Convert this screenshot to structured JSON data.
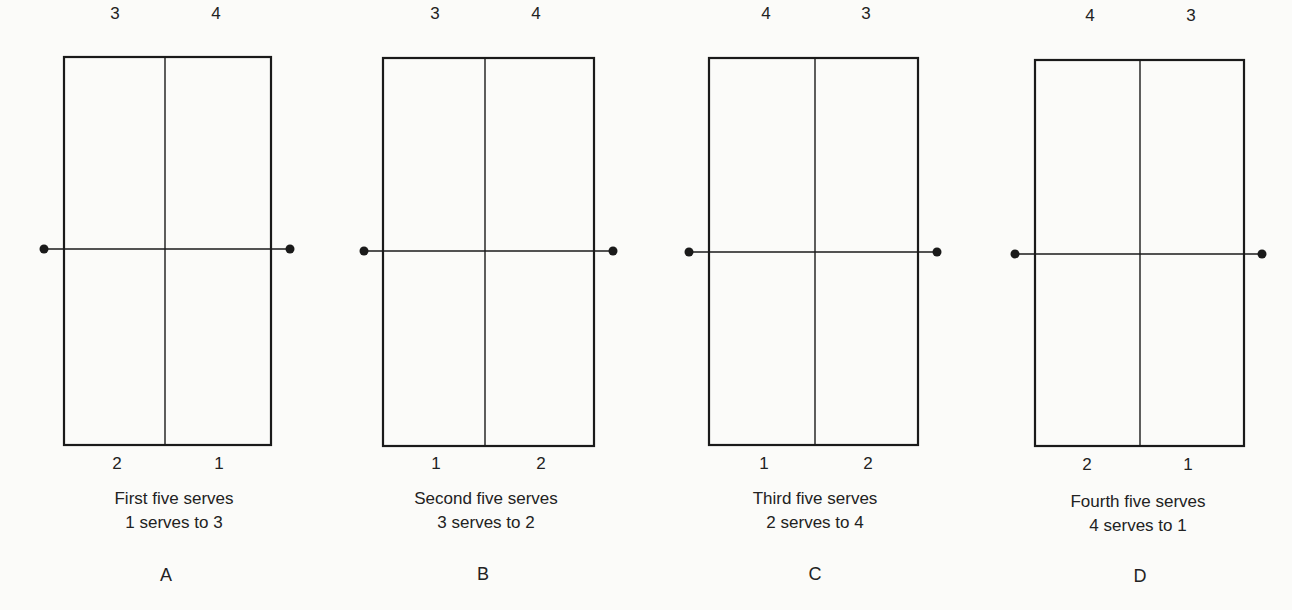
{
  "figure": {
    "line_color": "#1a1a1a",
    "panels": [
      {
        "letter": "A",
        "caption_line1": "First five serves",
        "caption_line2": "1 serves to 3",
        "top_left": "3",
        "top_right": "4",
        "bottom_left": "2",
        "bottom_right": "1",
        "box": {
          "x1": 64,
          "y1": 57,
          "x2": 271,
          "y2": 445,
          "cx": 165
        },
        "net": {
          "y": 249,
          "dot_left": 44,
          "dot_right": 290
        }
      },
      {
        "letter": "B",
        "caption_line1": "Second five serves",
        "caption_line2": "3 serves to 2",
        "top_left": "3",
        "top_right": "4",
        "bottom_left": "1",
        "bottom_right": "2",
        "box": {
          "x1": 383,
          "y1": 58,
          "x2": 594,
          "y2": 446,
          "cx": 485
        },
        "net": {
          "y": 251,
          "dot_left": 364,
          "dot_right": 613
        }
      },
      {
        "letter": "C",
        "caption_line1": "Third five serves",
        "caption_line2": "2 serves to 4",
        "top_left": "4",
        "top_right": "3",
        "bottom_left": "1",
        "bottom_right": "2",
        "box": {
          "x1": 709,
          "y1": 58,
          "x2": 918,
          "y2": 445,
          "cx": 815
        },
        "net": {
          "y": 252,
          "dot_left": 689,
          "dot_right": 937
        }
      },
      {
        "letter": "D",
        "caption_line1": "Fourth five serves",
        "caption_line2": "4 serves to 1",
        "top_left": "4",
        "top_right": "3",
        "bottom_left": "2",
        "bottom_right": "1",
        "box": {
          "x1": 1035,
          "y1": 60,
          "x2": 1244,
          "y2": 446,
          "cx": 1140
        },
        "net": {
          "y": 254,
          "dot_left": 1015,
          "dot_right": 1262
        }
      }
    ]
  }
}
